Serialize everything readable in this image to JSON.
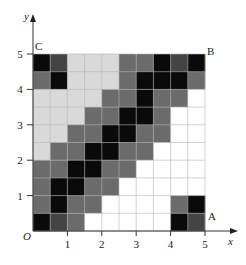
{
  "figure": {
    "axis_x_label": "x",
    "axis_y_label": "y",
    "origin_label": "O",
    "x_ticks": [
      "1",
      "2",
      "3",
      "4",
      "5"
    ],
    "y_ticks": [
      "1",
      "2",
      "3",
      "4",
      "5"
    ],
    "corner_labels": {
      "top_left": "C",
      "top_right": "B",
      "bottom_right": "A"
    },
    "grid_cells_per_row": 10,
    "grid_range": {
      "x": [
        0,
        5
      ],
      "y": [
        0,
        5
      ]
    },
    "palette": {
      "K": "#0a0a0a",
      "X": "#444444",
      "D": "#6b6b6b",
      "L": "#d9d9d9",
      "W": "#ffffff"
    },
    "rows_top_to_bottom": [
      [
        "K",
        "X",
        "L",
        "L",
        "L",
        "D",
        "D",
        "K",
        "X",
        "K"
      ],
      [
        "D",
        "K",
        "L",
        "L",
        "L",
        "D",
        "K",
        "K",
        "K",
        "D"
      ],
      [
        "L",
        "L",
        "L",
        "L",
        "D",
        "D",
        "K",
        "D",
        "D",
        "W"
      ],
      [
        "L",
        "L",
        "L",
        "D",
        "D",
        "K",
        "K",
        "D",
        "W",
        "W"
      ],
      [
        "L",
        "L",
        "D",
        "D",
        "K",
        "K",
        "D",
        "D",
        "W",
        "W"
      ],
      [
        "L",
        "D",
        "D",
        "K",
        "K",
        "D",
        "D",
        "W",
        "W",
        "W"
      ],
      [
        "D",
        "D",
        "K",
        "K",
        "D",
        "D",
        "W",
        "W",
        "W",
        "W"
      ],
      [
        "D",
        "K",
        "K",
        "D",
        "D",
        "W",
        "W",
        "W",
        "W",
        "W"
      ],
      [
        "D",
        "K",
        "D",
        "D",
        "W",
        "W",
        "W",
        "W",
        "D",
        "K"
      ],
      [
        "K",
        "X",
        "D",
        "W",
        "W",
        "W",
        "W",
        "W",
        "K",
        "X"
      ]
    ]
  }
}
